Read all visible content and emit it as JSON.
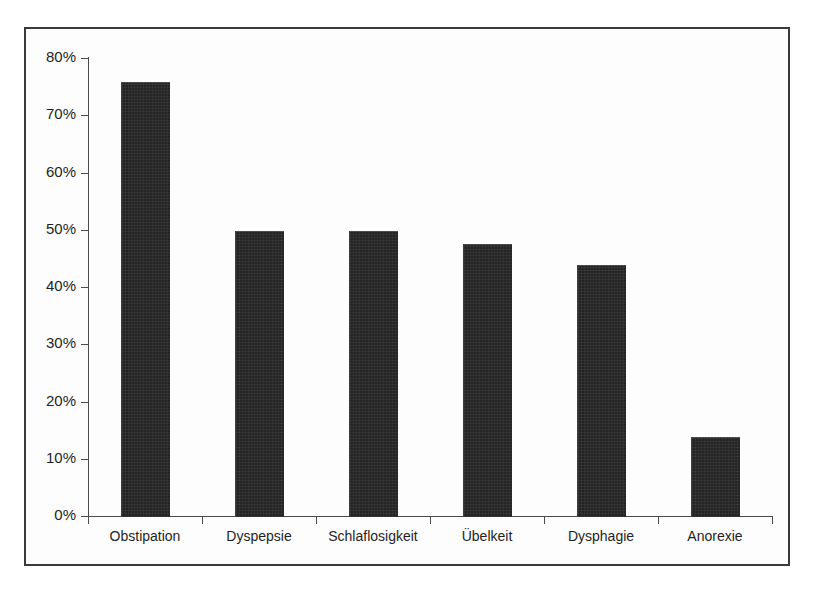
{
  "chart_data": {
    "type": "bar",
    "title": "",
    "subtitle": "",
    "xlabel": "",
    "ylabel": "",
    "categories": [
      "Obstipation",
      "Dyspepsie",
      "Schlaflosigkeit",
      "Übelkeit",
      "Dysphagie",
      "Anorexie"
    ],
    "values": [
      75.8,
      49.8,
      49.8,
      47.5,
      43.9,
      13.8
    ],
    "value_labels": [
      "75.8%",
      "49.8%",
      "49.8%",
      "47.5%",
      "43.9%",
      "13.8%"
    ],
    "ylim": [
      0,
      80
    ],
    "ytick_values": [
      0,
      10,
      20,
      30,
      40,
      50,
      60,
      70,
      80
    ],
    "ytick_labels": [
      "0%",
      "10%",
      "20%",
      "30%",
      "40%",
      "50%",
      "60%",
      "70%",
      "80%"
    ],
    "grid": false,
    "legend": null,
    "legend_position": "none",
    "bar_color": "#242424",
    "axis_color": "#4a4a4a",
    "frame_color": "#3a3a3a",
    "background_color": "#fdfdfd"
  }
}
